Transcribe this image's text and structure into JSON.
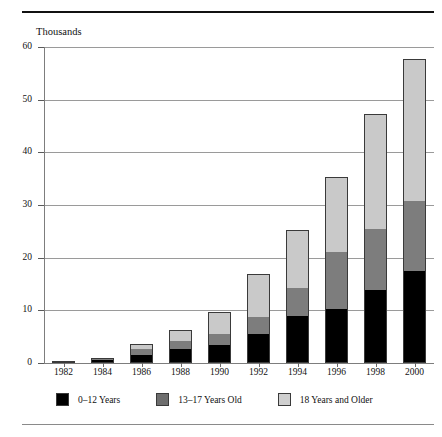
{
  "document": {
    "cropped_heading": "",
    "units_label": "Thousands"
  },
  "legend": {
    "items": [
      {
        "label": "0–12 Years",
        "color": "#000000",
        "swatch": "legend-swatch-0-12"
      },
      {
        "label": "13–17 Years Old",
        "color": "#6e6e6e",
        "swatch": "legend-swatch-13-17"
      },
      {
        "label": "18 Years and Older",
        "color": "#cfcfcf",
        "swatch": "legend-swatch-18-plus"
      }
    ]
  },
  "chart_data": {
    "type": "bar",
    "stacked": true,
    "title": "",
    "subtitle": "",
    "xlabel": "",
    "ylabel": "Thousands",
    "ylim": [
      0,
      60
    ],
    "yticks": [
      0,
      10,
      20,
      30,
      40,
      50,
      60
    ],
    "ytick_labels": [
      "0",
      "10",
      "20",
      "30",
      "40",
      "50",
      "60"
    ],
    "grid": true,
    "legend_position": "bottom",
    "categories": [
      "1982",
      "1984",
      "1986",
      "1988",
      "1990",
      "1992",
      "1994",
      "1996",
      "1998",
      "2000"
    ],
    "series": [
      {
        "name": "0–12 Years",
        "color": "#000000",
        "values": [
          0.1,
          0.6,
          1.6,
          2.6,
          3.4,
          5.6,
          9.0,
          10.2,
          13.9,
          17.4
        ]
      },
      {
        "name": "13–17 Years Old",
        "color": "#7d7d7d",
        "values": [
          0.1,
          0.3,
          1.0,
          1.5,
          2.1,
          3.2,
          5.2,
          10.8,
          11.5,
          13.4
        ]
      },
      {
        "name": "18 Years and Older",
        "color": "#c9c9c9",
        "values": [
          0.1,
          0.1,
          1.1,
          2.2,
          4.1,
          8.1,
          11.0,
          14.3,
          21.8,
          27.0
        ]
      }
    ],
    "totals": [
      0.3,
      1.0,
      3.7,
      6.3,
      9.6,
      16.9,
      25.2,
      35.3,
      47.2,
      57.8
    ]
  }
}
